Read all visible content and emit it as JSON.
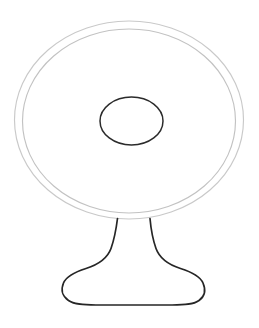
{
  "document": {
    "title": "Pedestal Table Line Drawing",
    "background_color": "#ffffff",
    "width": 259,
    "height": 328
  },
  "palette": {
    "outer_ring_stroke": "#c9c9c9",
    "inner_ring_stroke": "#c2c2c2",
    "center_ellipse_stroke": "#2b2b2b",
    "pedestal_stroke": "#262626",
    "fill": "none"
  },
  "artwork": {
    "name": "pedestal-table",
    "description": "Black and white outline drawing of a round pedestal table viewed from an elevated angle, with a circular top rendered as two concentric ellipses, a small ellipse at the center, and a flared stem resting on an oval base.",
    "shapes": [
      {
        "name": "table-top-outer-ellipse",
        "type": "ellipse",
        "cx": 129,
        "cy": 120,
        "rx": 114.5,
        "ry": 99,
        "stroke": "#c9c9c9",
        "stroke_width": 1.15,
        "fill": "none"
      },
      {
        "name": "table-top-inner-ellipse",
        "type": "ellipse",
        "cx": 129,
        "cy": 121,
        "rx": 106.5,
        "ry": 92,
        "stroke": "#c2c2c2",
        "stroke_width": 1.15,
        "fill": "none"
      },
      {
        "name": "center-ellipse",
        "type": "ellipse",
        "cx": 131.5,
        "cy": 121,
        "rx": 31.5,
        "ry": 24,
        "stroke": "#2b2b2b",
        "stroke_width": 1.5,
        "fill": "none"
      },
      {
        "name": "pedestal-stem-and-base",
        "type": "path",
        "path": "M 117.5 218.5 C 115.8 232 114.0 240 111.0 248.5 C 107.0 259.5 97.0 265.0 86.0 268.5 C 75.0 272.0 66.5 276.0 63.5 283.0 C 60.5 290.0 62.5 296.5 68.5 300.5 C 74.5 304.5 83.0 305.0 96.0 305.0 L 172.0 305.0 C 185.0 305.0 193.5 304.5 199.0 300.5 C 204.5 296.5 206.0 290.0 203.0 283.0 C 200.0 276.0 191.5 272.0 180.5 268.5 C 169.5 265.0 160.0 259.5 156.0 248.5 C 153.0 240 151.2 232 150.0 218.5",
        "stroke": "#262626",
        "stroke_width": 1.7,
        "fill": "none"
      }
    ],
    "bounds": {
      "top_y": 21,
      "bottom_y": 305,
      "left_x": 14,
      "right_x": 244
    }
  }
}
